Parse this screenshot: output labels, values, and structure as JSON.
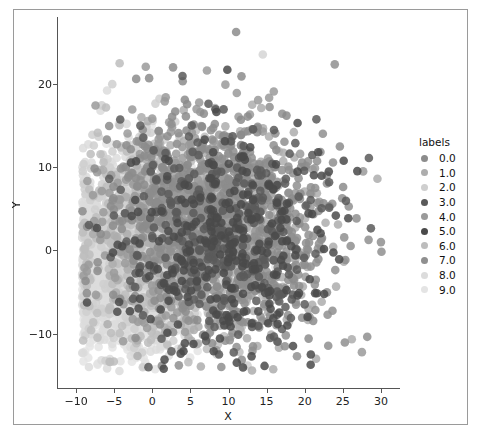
{
  "figure": {
    "background": "#ffffff",
    "frame_border": "#9a9a9a"
  },
  "axes": {
    "xlabel": "X",
    "ylabel": "Y",
    "xticks": [
      "-10",
      "-5",
      "0",
      "5",
      "10",
      "15",
      "20",
      "25",
      "30"
    ],
    "yticks": [
      "-10",
      "0",
      "10",
      "20"
    ],
    "xlim": [
      -12.5,
      32.5
    ],
    "ylim": [
      -16.5,
      28.0
    ],
    "spine_color": "#555555",
    "grid": false
  },
  "legend": {
    "title": "labels",
    "position": "right",
    "entries": [
      {
        "label": "0.0",
        "color": "#8c8c8c"
      },
      {
        "label": "1.0",
        "color": "#adadad"
      },
      {
        "label": "2.0",
        "color": "#cfcfcf"
      },
      {
        "label": "3.0",
        "color": "#5a5a5a"
      },
      {
        "label": "4.0",
        "color": "#9a9a9a"
      },
      {
        "label": "5.0",
        "color": "#4a4a4a"
      },
      {
        "label": "6.0",
        "color": "#bdbdbd"
      },
      {
        "label": "7.0",
        "color": "#8f8f8f"
      },
      {
        "label": "8.0",
        "color": "#dcdcdc"
      },
      {
        "label": "9.0",
        "color": "#e4e4e4"
      }
    ]
  },
  "chart_data": {
    "type": "scatter",
    "title": "",
    "xlabel": "X",
    "ylabel": "Y",
    "xlim": [
      -12.5,
      32.5
    ],
    "ylim": [
      -16.5,
      28.0
    ],
    "grid": false,
    "legend_title": "labels",
    "marker_size": 6,
    "marker_alpha": 0.85,
    "series": [
      {
        "name": "0.0",
        "color": "#8c8c8c",
        "n": 420,
        "center": [
          6.0,
          4.0
        ],
        "spread": [
          6.0,
          6.5
        ]
      },
      {
        "name": "1.0",
        "color": "#adadad",
        "n": 400,
        "center": [
          8.5,
          1.0
        ],
        "spread": [
          6.5,
          6.5
        ]
      },
      {
        "name": "2.0",
        "color": "#cfcfcf",
        "n": 380,
        "center": [
          -1.0,
          2.0
        ],
        "spread": [
          5.0,
          6.0
        ]
      },
      {
        "name": "3.0",
        "color": "#5a5a5a",
        "n": 300,
        "center": [
          9.0,
          2.5
        ],
        "spread": [
          6.5,
          7.0
        ]
      },
      {
        "name": "4.0",
        "color": "#9a9a9a",
        "n": 400,
        "center": [
          5.5,
          5.0
        ],
        "spread": [
          6.5,
          6.5
        ]
      },
      {
        "name": "5.0",
        "color": "#4a4a4a",
        "n": 260,
        "center": [
          10.0,
          0.0
        ],
        "spread": [
          7.0,
          7.0
        ]
      },
      {
        "name": "6.0",
        "color": "#bdbdbd",
        "n": 420,
        "center": [
          2.0,
          1.0
        ],
        "spread": [
          6.0,
          6.5
        ]
      },
      {
        "name": "7.0",
        "color": "#8f8f8f",
        "n": 430,
        "center": [
          12.0,
          2.0
        ],
        "spread": [
          7.0,
          6.5
        ]
      },
      {
        "name": "8.0",
        "color": "#dcdcdc",
        "n": 900,
        "center": [
          -3.0,
          -1.0
        ],
        "spread": [
          4.5,
          5.5
        ]
      },
      {
        "name": "9.0",
        "color": "#e4e4e4",
        "n": 1000,
        "center": [
          -2.0,
          -2.0
        ],
        "spread": [
          4.5,
          5.5
        ]
      }
    ],
    "outliers": [
      {
        "x": 11.0,
        "y": 26.2,
        "color": "#8c8c8c"
      },
      {
        "x": 14.5,
        "y": 23.5,
        "color": "#d5d5d5"
      },
      {
        "x": 12.5,
        "y": -13.8,
        "color": "#cfcfcf"
      },
      {
        "x": 27.5,
        "y": -12.2,
        "color": "#9a9a9a"
      },
      {
        "x": -0.5,
        "y": -14.0,
        "color": "#5a5a5a"
      },
      {
        "x": 1.5,
        "y": -14.2,
        "color": "#4a4a4a"
      },
      {
        "x": 30.0,
        "y": 1.0,
        "color": "#8f8f8f"
      }
    ]
  }
}
